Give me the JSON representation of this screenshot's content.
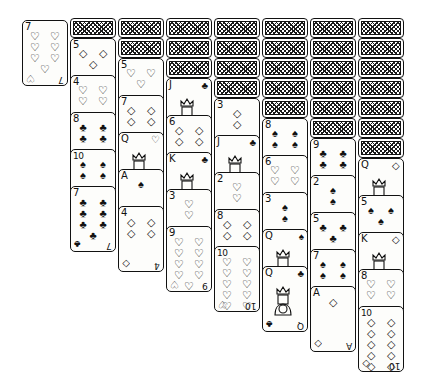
{
  "game": {
    "name": "Spider Solitaire",
    "layout": "eight-column tableau with one free cell card",
    "card_width_px": 46,
    "card_height_px": 66,
    "facedown_step_px": 20,
    "faceup_step_px": 37
  },
  "symbols": {
    "hearts": "♡",
    "diamonds": "◇",
    "clubs": "♣",
    "spades": "♠"
  },
  "freecell": {
    "label": "free-cell",
    "card": {
      "rank": "7",
      "suit": "hearts",
      "color": "outline"
    }
  },
  "columns": [
    {
      "index": 1,
      "x": 22,
      "y": 20,
      "facedown_count": 0,
      "faceup": [
        {
          "rank": "7",
          "suit": "hearts"
        }
      ]
    },
    {
      "index": 2,
      "x": 70,
      "y": 18,
      "facedown_count": 1,
      "faceup": [
        {
          "rank": "5",
          "suit": "diamonds"
        },
        {
          "rank": "4",
          "suit": "hearts"
        },
        {
          "rank": "8",
          "suit": "clubs"
        },
        {
          "rank": "10",
          "suit": "spades"
        },
        {
          "rank": "7",
          "suit": "clubs"
        }
      ]
    },
    {
      "index": 3,
      "x": 118,
      "y": 18,
      "facedown_count": 2,
      "faceup": [
        {
          "rank": "5",
          "suit": "hearts"
        },
        {
          "rank": "7",
          "suit": "diamonds"
        },
        {
          "rank": "Q",
          "suit": "hearts"
        },
        {
          "rank": "A",
          "suit": "spades"
        },
        {
          "rank": "4",
          "suit": "diamonds"
        }
      ]
    },
    {
      "index": 4,
      "x": 166,
      "y": 18,
      "facedown_count": 3,
      "faceup": [
        {
          "rank": "J",
          "suit": "clubs"
        },
        {
          "rank": "6",
          "suit": "diamonds"
        },
        {
          "rank": "K",
          "suit": "clubs"
        },
        {
          "rank": "3",
          "suit": "hearts"
        },
        {
          "rank": "9",
          "suit": "hearts"
        }
      ]
    },
    {
      "index": 5,
      "x": 214,
      "y": 18,
      "facedown_count": 4,
      "faceup": [
        {
          "rank": "3",
          "suit": "diamonds"
        },
        {
          "rank": "J",
          "suit": "clubs"
        },
        {
          "rank": "2",
          "suit": "hearts"
        },
        {
          "rank": "8",
          "suit": "diamonds"
        },
        {
          "rank": "10",
          "suit": "hearts"
        }
      ]
    },
    {
      "index": 6,
      "x": 262,
      "y": 18,
      "facedown_count": 5,
      "faceup": [
        {
          "rank": "8",
          "suit": "spades"
        },
        {
          "rank": "6",
          "suit": "hearts"
        },
        {
          "rank": "3",
          "suit": "spades"
        },
        {
          "rank": "Q",
          "suit": "spades"
        },
        {
          "rank": "Q",
          "suit": "clubs"
        }
      ]
    },
    {
      "index": 7,
      "x": 310,
      "y": 18,
      "facedown_count": 6,
      "faceup": [
        {
          "rank": "9",
          "suit": "clubs"
        },
        {
          "rank": "2",
          "suit": "spades"
        },
        {
          "rank": "5",
          "suit": "clubs"
        },
        {
          "rank": "7",
          "suit": "spades"
        },
        {
          "rank": "A",
          "suit": "diamonds"
        }
      ]
    },
    {
      "index": 8,
      "x": 358,
      "y": 18,
      "facedown_count": 7,
      "faceup": [
        {
          "rank": "Q",
          "suit": "diamonds"
        },
        {
          "rank": "5",
          "suit": "spades"
        },
        {
          "rank": "K",
          "suit": "diamonds"
        },
        {
          "rank": "8",
          "suit": "hearts"
        },
        {
          "rank": "10",
          "suit": "diamonds"
        }
      ]
    }
  ]
}
